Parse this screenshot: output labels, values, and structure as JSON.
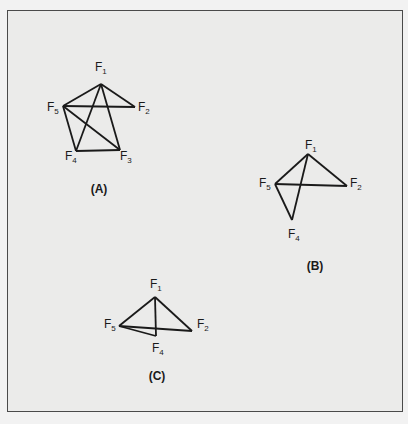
{
  "figure": {
    "graphs": [
      {
        "id": "A",
        "caption": "(A)",
        "caption_pos": [
          99,
          193
        ],
        "nodes": [
          {
            "name": "F",
            "sub": "1",
            "label_pos": [
              95,
              71
            ],
            "anchor": [
              101,
              84
            ]
          },
          {
            "name": "F",
            "sub": "2",
            "label_pos": [
              138,
              111
            ],
            "anchor": [
              135,
              107
            ]
          },
          {
            "name": "F",
            "sub": "3",
            "label_pos": [
              120,
              160
            ],
            "anchor": [
              120,
              150
            ]
          },
          {
            "name": "F",
            "sub": "4",
            "label_pos": [
              65,
              160
            ],
            "anchor": [
              76,
              151
            ]
          },
          {
            "name": "F",
            "sub": "5",
            "label_pos": [
              47,
              111
            ],
            "anchor": [
              63,
              106
            ]
          }
        ],
        "edges": [
          [
            "1",
            "5"
          ],
          [
            "1",
            "2"
          ],
          [
            "1",
            "4"
          ],
          [
            "1",
            "3"
          ],
          [
            "5",
            "2"
          ],
          [
            "5",
            "4"
          ],
          [
            "5",
            "3"
          ],
          [
            "4",
            "3"
          ]
        ]
      },
      {
        "id": "B",
        "caption": "(B)",
        "caption_pos": [
          315,
          270
        ],
        "nodes": [
          {
            "name": "F",
            "sub": "1",
            "label_pos": [
              305,
              149
            ],
            "anchor": [
              308,
              154
            ]
          },
          {
            "name": "F",
            "sub": "2",
            "label_pos": [
              350,
              187
            ],
            "anchor": [
              347,
              186
            ]
          },
          {
            "name": "F",
            "sub": "4",
            "label_pos": [
              288,
              238
            ],
            "anchor": [
              292,
              220
            ]
          },
          {
            "name": "F",
            "sub": "5",
            "label_pos": [
              259,
              187
            ],
            "anchor": [
              275,
              184
            ]
          }
        ],
        "edges": [
          [
            "1",
            "5"
          ],
          [
            "1",
            "2"
          ],
          [
            "1",
            "4"
          ],
          [
            "5",
            "2"
          ],
          [
            "5",
            "4"
          ]
        ]
      },
      {
        "id": "C",
        "caption": "(C)",
        "caption_pos": [
          157,
          380
        ],
        "nodes": [
          {
            "name": "F",
            "sub": "1",
            "label_pos": [
              150,
              288
            ],
            "anchor": [
              155,
              297
            ]
          },
          {
            "name": "F",
            "sub": "2",
            "label_pos": [
              197,
              328
            ],
            "anchor": [
              192,
              331
            ]
          },
          {
            "name": "F",
            "sub": "4",
            "label_pos": [
              152,
              352
            ],
            "anchor": [
              156,
              336
            ]
          },
          {
            "name": "F",
            "sub": "5",
            "label_pos": [
              104,
              328
            ],
            "anchor": [
              119,
              326
            ]
          }
        ],
        "edges": [
          [
            "1",
            "5"
          ],
          [
            "1",
            "2"
          ],
          [
            "1",
            "4"
          ],
          [
            "5",
            "2"
          ],
          [
            "5",
            "4"
          ]
        ]
      }
    ]
  }
}
